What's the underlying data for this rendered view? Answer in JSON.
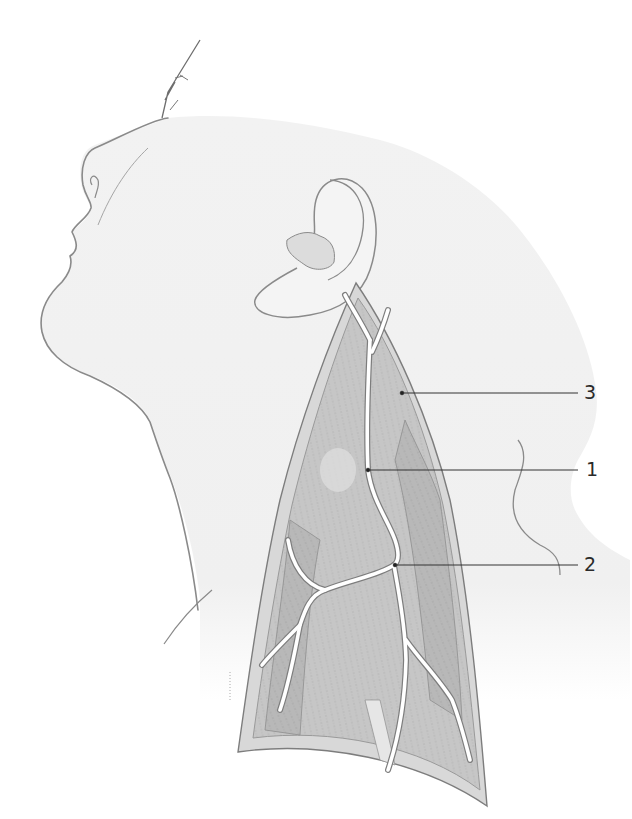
{
  "figure": {
    "colors": {
      "background": "#ffffff",
      "skin_shade": "#efefef",
      "outline": "#8a8a8a",
      "muscle": "#c9c9c9",
      "muscle_dark": "#b3b3b3",
      "vessel": "#ffffff",
      "vessel_edge": "#7d7d7d",
      "leader_line": "#333333",
      "label_text": "#2a2a2a"
    }
  },
  "labels": [
    {
      "id": "3",
      "text": "3",
      "target_x": 402,
      "target_y": 393,
      "text_x": 584,
      "text_y": 383
    },
    {
      "id": "1",
      "text": "1",
      "target_x": 368,
      "target_y": 470,
      "text_x": 586,
      "text_y": 460
    },
    {
      "id": "2",
      "text": "2",
      "target_x": 395,
      "target_y": 565,
      "text_x": 584,
      "text_y": 555
    }
  ]
}
